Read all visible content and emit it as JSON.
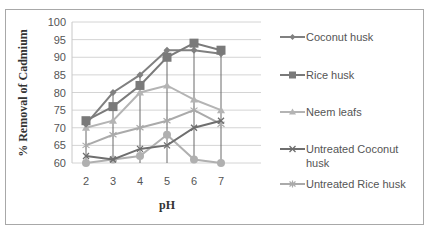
{
  "chart_data": {
    "type": "line",
    "title": "",
    "xlabel": "pH",
    "ylabel": "% Removal of Cadmium",
    "x": [
      2,
      3,
      4,
      5,
      6,
      7
    ],
    "ylim": [
      60,
      100
    ],
    "yticks": [
      60,
      65,
      70,
      75,
      80,
      85,
      90,
      95,
      100
    ],
    "grid": true,
    "legend_position": "right",
    "series": [
      {
        "name": "Coconut husk",
        "marker": "diamond",
        "color": "#808080",
        "values": [
          71,
          80,
          85,
          92,
          92,
          91
        ]
      },
      {
        "name": "Rice husk",
        "marker": "square",
        "color": "#7a7a7a",
        "values": [
          72,
          76,
          82,
          90,
          94,
          92
        ]
      },
      {
        "name": "Neem leafs",
        "marker": "triangle",
        "color": "#b4b4b4",
        "values": [
          70,
          72,
          80,
          82,
          78,
          75
        ]
      },
      {
        "name": "Untreated Coconut husk",
        "marker": "x",
        "color": "#6e6e6e",
        "values": [
          62,
          61,
          64,
          65,
          70,
          72
        ]
      },
      {
        "name": "Untreated Rice husk",
        "marker": "star",
        "color": "#aaaaaa",
        "values": [
          65,
          68,
          70,
          72,
          75,
          71
        ]
      },
      {
        "name": "",
        "marker": "circle",
        "color": "#b0b0b0",
        "values": [
          60,
          61,
          62,
          68,
          61,
          60
        ]
      }
    ]
  },
  "legend": {
    "items": [
      {
        "label_line1": "Coconut husk",
        "label_line2": ""
      },
      {
        "label_line1": "Rice husk",
        "label_line2": ""
      },
      {
        "label_line1": "Neem leafs",
        "label_line2": ""
      },
      {
        "label_line1": "Untreated Coconut",
        "label_line2": "husk"
      },
      {
        "label_line1": "Untreated Rice husk",
        "label_line2": ""
      }
    ]
  }
}
